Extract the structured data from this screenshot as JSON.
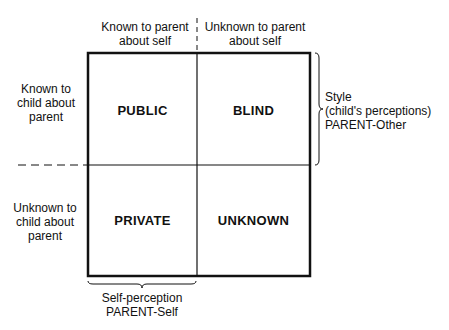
{
  "top_labels": {
    "left": [
      "Known to parent",
      "about self"
    ],
    "right": [
      "Unknown to parent",
      "about self"
    ]
  },
  "side_labels": {
    "top": [
      "Known to",
      "child about",
      "parent"
    ],
    "bottom": [
      "Unknown to",
      "child about",
      "parent"
    ]
  },
  "quadrants": {
    "top_left": "PUBLIC",
    "top_right": "BLIND",
    "bottom_left": "PRIVATE",
    "bottom_right": "UNKNOWN"
  },
  "right_brace_label": [
    "Style",
    "(child's perceptions)",
    "PARENT-Other"
  ],
  "bottom_brace_label": [
    "Self-perception",
    "PARENT-Self"
  ]
}
